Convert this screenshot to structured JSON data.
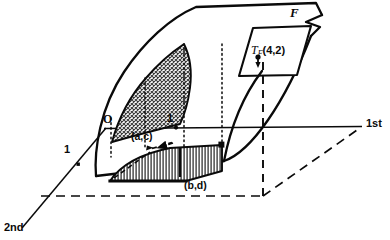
{
  "figure": {
    "kind": "3d-calculus-diagram",
    "background_color": "#ffffff",
    "ink_color": "#0a0a0a"
  },
  "axes": {
    "first": {
      "label": "1st",
      "tick_label": "1"
    },
    "second": {
      "label": "2nd",
      "tick_label": "1"
    },
    "origin_label": "O"
  },
  "labels": {
    "surface": "F",
    "tangent_plane_symbol": "T",
    "tangent_plane_subscript": "F",
    "tangent_plane_point": "(4,2)",
    "domain_corner_near": "(a,c)",
    "domain_corner_far": "(b,d)"
  },
  "regions": {
    "surface_patch": {
      "fill": "cross-hatch",
      "color": "#3a3a3a"
    },
    "domain_rectangle": {
      "fill": "vertical-hatch",
      "color": "#2a2a2a"
    },
    "base_plane": {
      "stroke": "dashed"
    }
  }
}
